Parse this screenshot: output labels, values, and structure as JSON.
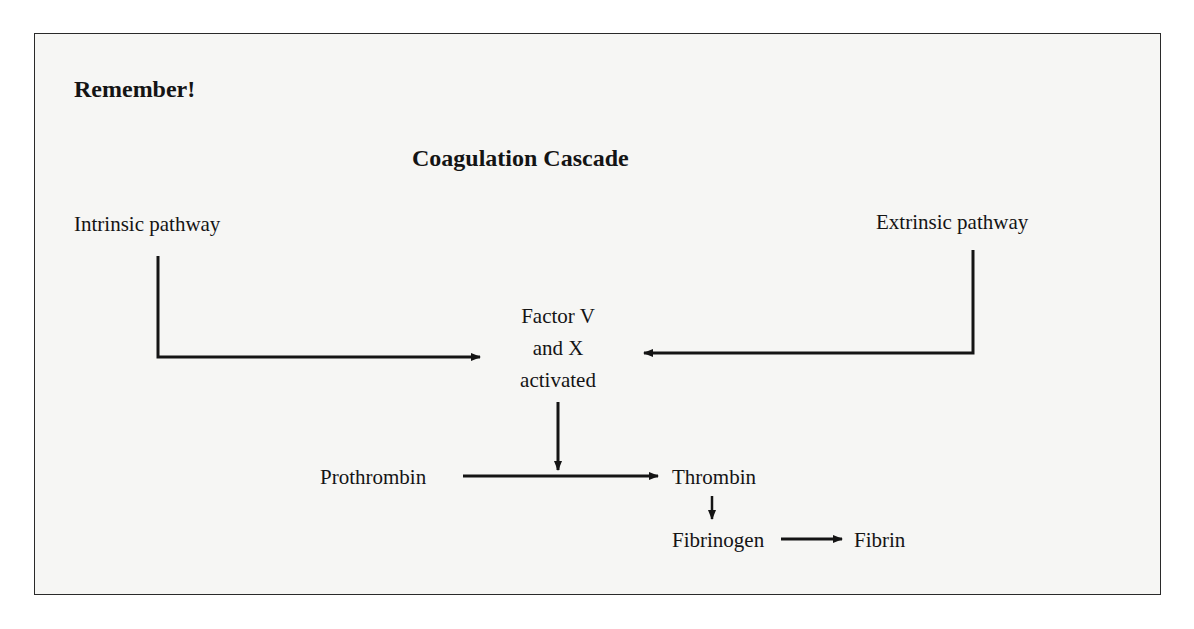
{
  "header": {
    "remember": "Remember!",
    "title": "Coagulation Cascade"
  },
  "nodes": {
    "intrinsic": "Intrinsic pathway",
    "extrinsic": "Extrinsic pathway",
    "factor_line1": "Factor V",
    "factor_line2": "and X",
    "factor_line3": "activated",
    "prothrombin": "Prothrombin",
    "thrombin": "Thrombin",
    "fibrinogen": "Fibrinogen",
    "fibrin": "Fibrin"
  },
  "edges": [
    {
      "from": "Intrinsic pathway",
      "to": "Factor V and X activated"
    },
    {
      "from": "Extrinsic pathway",
      "to": "Factor V and X activated"
    },
    {
      "from": "Factor V and X activated",
      "to": "Prothrombin → Thrombin"
    },
    {
      "from": "Prothrombin",
      "to": "Thrombin"
    },
    {
      "from": "Thrombin",
      "to": "Fibrinogen"
    },
    {
      "from": "Fibrinogen",
      "to": "Fibrin"
    }
  ],
  "colors": {
    "ink": "#141414",
    "paper": "#f6f6f4"
  }
}
